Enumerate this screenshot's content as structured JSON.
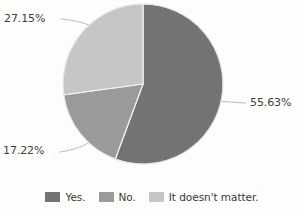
{
  "chart_data": {
    "type": "pie",
    "title": "",
    "labels": [
      "Yes.",
      "No.",
      "It doesn't matter."
    ],
    "values": [
      55.63,
      17.22,
      27.15
    ],
    "value_labels": [
      "55.63%",
      "17.22%",
      "27.15%"
    ],
    "colors": [
      "#737373",
      "#9a9a9a",
      "#c6c6c6"
    ],
    "start_angle_deg": 0,
    "direction": "clockwise",
    "legend": {
      "position": "bottom",
      "entries": [
        {
          "label": "Yes.",
          "color": "#737373",
          "value": 55.63,
          "value_label": "55.63%"
        },
        {
          "label": "No.",
          "color": "#9a9a9a",
          "value": 17.22,
          "value_label": "17.22%"
        },
        {
          "label": "It doesn't matter.",
          "color": "#c6c6c6",
          "value": 27.15,
          "value_label": "27.15%"
        }
      ]
    },
    "annotations": [
      {
        "text": "55.63%",
        "slice": "Yes.",
        "leader_line": true
      },
      {
        "text": "17.22%",
        "slice": "No.",
        "leader_line": true
      },
      {
        "text": "27.15%",
        "slice": "It doesn't matter.",
        "leader_line": true
      }
    ],
    "grid": false,
    "xlabel": "",
    "ylabel": ""
  },
  "slices": {
    "yes": {
      "pct_text": "55.63%",
      "color": "#737373"
    },
    "no": {
      "pct_text": "17.22%",
      "color": "#9a9a9a"
    },
    "matter": {
      "pct_text": "27.15%",
      "color": "#c6c6c6"
    }
  },
  "legend": {
    "yes_label": "Yes.",
    "no_label": "No.",
    "matter_label": "It doesn't matter."
  },
  "style": {
    "background": "#fdfdfb",
    "slice_border": "#f4f4f2",
    "leader_line": "#b9b9b9",
    "text": "#3a3a3a"
  }
}
